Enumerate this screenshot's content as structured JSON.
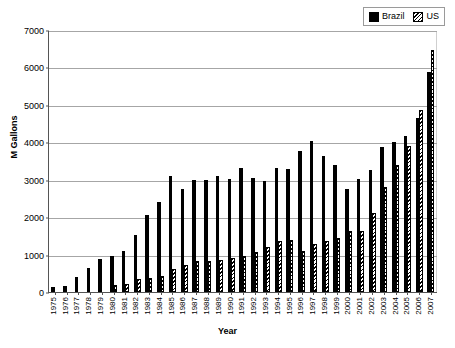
{
  "chart_data": {
    "type": "bar",
    "title": "",
    "xlabel": "Year",
    "ylabel": "M Gallons",
    "ylim": [
      0,
      7000
    ],
    "ytick_values": [
      0,
      1000,
      2000,
      3000,
      4000,
      5000,
      6000,
      7000
    ],
    "ytick_labels": [
      "0",
      "1000",
      "2000",
      "3000",
      "4000",
      "5000",
      "6000",
      "7000"
    ],
    "grid": "horizontal",
    "legend_position": "top-right",
    "categories": [
      "1975",
      "1976",
      "1977",
      "1978",
      "1979",
      "1980",
      "1981",
      "1982",
      "1983",
      "1984",
      "1985",
      "1986",
      "1987",
      "1988",
      "1989",
      "1990",
      "1991",
      "1992",
      "1993",
      "1994",
      "1995",
      "1996",
      "1997",
      "1998",
      "1999",
      "2000",
      "2001",
      "2002",
      "2003",
      "2004",
      "2005",
      "2006",
      "2007"
    ],
    "series": [
      {
        "name": "Brazil",
        "fill": "solid-black",
        "color": "#000000",
        "values": [
          145,
          160,
          390,
          650,
          890,
          960,
          1090,
          1510,
          2050,
          2400,
          3090,
          2740,
          3000,
          2990,
          3110,
          3020,
          3320,
          3050,
          2960,
          3320,
          3290,
          3780,
          4030,
          3640,
          3400,
          2760,
          3010,
          3270,
          3870,
          4020,
          4160,
          4640,
          5870
        ]
      },
      {
        "name": "US",
        "fill": "diagonal-hatch",
        "color": "#000000",
        "values": [
          0,
          0,
          0,
          0,
          0,
          175,
          205,
          350,
          375,
          430,
          610,
          710,
          830,
          830,
          860,
          900,
          950,
          1080,
          1200,
          1350,
          1400,
          1100,
          1290,
          1370,
          1450,
          1620,
          1630,
          2110,
          2800,
          3400,
          3900,
          4850,
          6470
        ]
      }
    ]
  },
  "legend": {
    "entries": [
      {
        "label": "Brazil",
        "swatch": "solid-black-square"
      },
      {
        "label": "US",
        "swatch": "hatched-square"
      }
    ]
  },
  "axes": {
    "y_title": "M Gallons",
    "x_title": "Year"
  },
  "caption": ""
}
